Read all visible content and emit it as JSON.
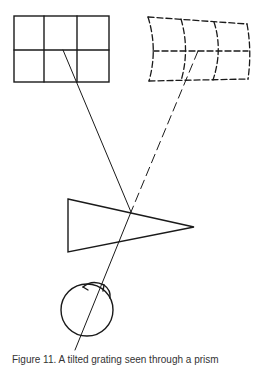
{
  "figure": {
    "caption": "Figure 11. A tilted grating seen through a prism",
    "stroke_color": "#1a1a1a",
    "background": "#ffffff"
  },
  "elements": {
    "object_grid": {
      "label": "real-grid",
      "rows": 2,
      "cols": 3,
      "style": "solid"
    },
    "virtual_grid": {
      "label": "distorted-virtual-grid",
      "rows": 2,
      "cols": 3,
      "style": "dashed"
    },
    "prism": {
      "label": "prism",
      "shape": "triangle"
    },
    "eye": {
      "label": "eye"
    },
    "rays": [
      {
        "label": "actual-ray",
        "style": "solid"
      },
      {
        "label": "apparent-ray",
        "style": "dashed"
      }
    ]
  }
}
